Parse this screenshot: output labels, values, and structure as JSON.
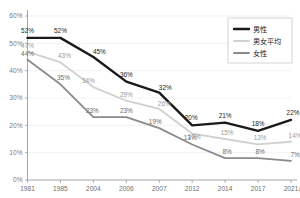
{
  "clipped_header_text": "",
  "legend": {
    "position": "top-right",
    "entries": [
      {
        "label": "男性",
        "color": "#1a1a1a",
        "width": 2.4
      },
      {
        "label": "男女平均",
        "color": "#d0d0d0",
        "width": 1.8
      },
      {
        "label": "女性",
        "color": "#8a8a8a",
        "width": 1.8
      }
    ]
  },
  "axis": {
    "y_ticks": [
      "0%",
      "10%",
      "20%",
      "30%",
      "40%",
      "50%",
      "60%"
    ],
    "x_unit_label": "(年)"
  },
  "chart_data": {
    "type": "line",
    "title": "",
    "subtitle": "",
    "xlabel": "(年)",
    "ylabel": "",
    "categories": [
      "1981",
      "1985",
      "2004",
      "2006",
      "2007",
      "2012",
      "2014",
      "2017",
      "2021"
    ],
    "ylim": [
      0,
      60
    ],
    "yticks": [
      0,
      10,
      20,
      30,
      40,
      50,
      60
    ],
    "ytick_labels": [
      "0%",
      "10%",
      "20%",
      "30%",
      "40%",
      "50%",
      "60%"
    ],
    "grid": true,
    "legend_position": "top-right",
    "value_labels": true,
    "value_label_suffix": "%",
    "series": [
      {
        "name": "男性",
        "color": "#1a1a1a",
        "line_width": 2.4,
        "values": [
          52,
          52,
          45,
          36,
          32,
          20,
          21,
          18,
          22
        ],
        "labels": [
          "52%",
          "52%",
          "45%",
          "36%",
          "32%",
          "20%",
          "21%",
          "18%",
          "22%"
        ]
      },
      {
        "name": "男女平均",
        "color": "#d0d0d0",
        "line_width": 1.8,
        "values": [
          47,
          43,
          34,
          29,
          26,
          17,
          15,
          13,
          14
        ],
        "labels": [
          "47%",
          "43%",
          "34%",
          "29%",
          "26%",
          "17%",
          "15%",
          "13%",
          "14%"
        ]
      },
      {
        "name": "女性",
        "color": "#8a8a8a",
        "line_width": 1.8,
        "values": [
          44,
          35,
          23,
          23,
          19,
          13,
          8,
          8,
          7
        ],
        "labels": [
          "44%",
          "35%",
          "23%",
          "23%",
          "19%",
          "13%",
          "8%",
          "8%",
          "7%"
        ]
      }
    ]
  }
}
